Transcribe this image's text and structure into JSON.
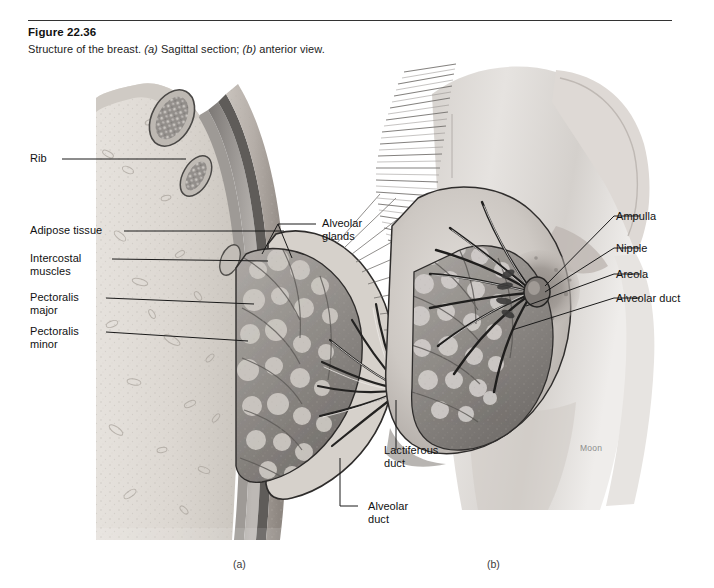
{
  "figure": {
    "number": "Figure 22.36",
    "caption_parts": {
      "lead": "Structure of the breast. ",
      "a_tag": "(a)",
      "a_text": " Sagittal section; ",
      "b_tag": "(b)",
      "b_text": " anterior view."
    },
    "caption_full": "Structure of the breast. (a) Sagittal section; (b) anterior view."
  },
  "panels": [
    {
      "id": "a",
      "label": "(a)",
      "view": "Sagittal section"
    },
    {
      "id": "b",
      "label": "(b)",
      "view": "anterior view"
    }
  ],
  "labels": {
    "left": [
      {
        "name": "rib",
        "text": "Rib"
      },
      {
        "name": "adipose-tissue",
        "text": "Adipose tissue"
      },
      {
        "name": "intercostal-muscles",
        "line1": "Intercostal",
        "line2": "muscles"
      },
      {
        "name": "pectoralis-major",
        "line1": "Pectoralis",
        "line2": "major"
      },
      {
        "name": "pectoralis-minor",
        "line1": "Pectoralis",
        "line2": "minor"
      }
    ],
    "center": [
      {
        "name": "alveolar-glands",
        "line1": "Alveolar",
        "line2": "glands"
      },
      {
        "name": "lactiferous-duct",
        "line1": "Lactiferous",
        "line2": "duct"
      },
      {
        "name": "alveolar-duct-a",
        "line1": "Alveolar",
        "line2": "duct"
      }
    ],
    "right": [
      {
        "name": "ampulla",
        "text": "Ampulla"
      },
      {
        "name": "nipple",
        "text": "Nipple"
      },
      {
        "name": "areola",
        "text": "Areola"
      },
      {
        "name": "alveolar-duct-b",
        "text": "Alveolar duct"
      }
    ]
  },
  "artist_signature": "Moon",
  "colors": {
    "background": "#ffffff",
    "rule": "#333333",
    "text": "#111111",
    "leader_line": "#1a1a1a",
    "skin_light": "#e9e6e3",
    "skin_mid": "#cfcac6",
    "skin_shadow": "#a9a4a0",
    "fat_tissue": "#dedad5",
    "gland_tissue": "#8e8b88",
    "muscle_dark": "#6b6866",
    "duct_dark": "#2c2b2a"
  }
}
